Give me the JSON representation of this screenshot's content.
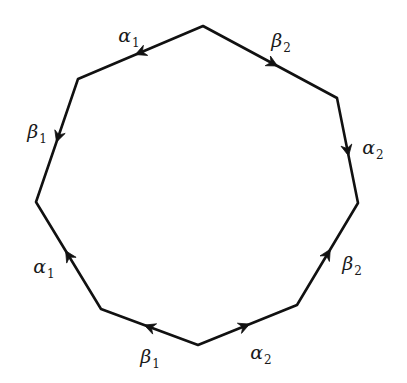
{
  "diagram": {
    "stroke_color": "#111111",
    "background": "#ffffff",
    "vertices": [
      {
        "id": "V0",
        "x": 203,
        "y": 26
      },
      {
        "id": "V1",
        "x": 337,
        "y": 98
      },
      {
        "id": "V2",
        "x": 358,
        "y": 203
      },
      {
        "id": "V3",
        "x": 297,
        "y": 305
      },
      {
        "id": "V4",
        "x": 198,
        "y": 345
      },
      {
        "id": "V5",
        "x": 101,
        "y": 309
      },
      {
        "id": "V6",
        "x": 36,
        "y": 202
      },
      {
        "id": "V7",
        "x": 78,
        "y": 79
      }
    ],
    "edges": [
      {
        "name": "edge-alpha1-top",
        "symbol": "α",
        "index": "1",
        "from": "V0",
        "to": "V7",
        "arrow_t": 0.5,
        "label_x": 129,
        "label_y": 35
      },
      {
        "name": "edge-beta1-left",
        "symbol": "β",
        "index": "1",
        "from": "V7",
        "to": "V6",
        "arrow_t": 0.47,
        "label_x": 37,
        "label_y": 131
      },
      {
        "name": "edge-beta2-top",
        "symbol": "β",
        "index": "2",
        "from": "V0",
        "to": "V1",
        "arrow_t": 0.52,
        "label_x": 281,
        "label_y": 40
      },
      {
        "name": "edge-alpha2-right",
        "symbol": "α",
        "index": "2",
        "from": "V1",
        "to": "V2",
        "arrow_t": 0.5,
        "label_x": 373,
        "label_y": 147
      },
      {
        "name": "edge-alpha1-lower",
        "symbol": "α",
        "index": "1",
        "from": "V5",
        "to": "V6",
        "arrow_t": 0.5,
        "label_x": 44,
        "label_y": 266
      },
      {
        "name": "edge-beta1-bottom",
        "symbol": "β",
        "index": "1",
        "from": "V4",
        "to": "V5",
        "arrow_t": 0.5,
        "label_x": 150,
        "label_y": 356
      },
      {
        "name": "edge-alpha2-bottom",
        "symbol": "α",
        "index": "2",
        "from": "V4",
        "to": "V3",
        "arrow_t": 0.47,
        "label_x": 261,
        "label_y": 352
      },
      {
        "name": "edge-beta2-right",
        "symbol": "β",
        "index": "2",
        "from": "V3",
        "to": "V2",
        "arrow_t": 0.5,
        "label_x": 352,
        "label_y": 263
      }
    ]
  }
}
